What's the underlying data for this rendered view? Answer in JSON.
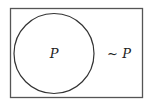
{
  "diagram": {
    "type": "venn",
    "universe": {
      "label": ""
    },
    "set": {
      "label": "P"
    },
    "complement": {
      "label": "~ P"
    },
    "colors": {
      "stroke": "#333333",
      "text": "#222222",
      "background": "#ffffff"
    }
  }
}
